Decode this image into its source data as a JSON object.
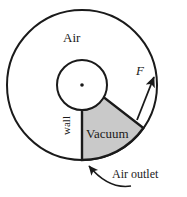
{
  "figure": {
    "labels": {
      "air": "Air",
      "vacuum": "Vacuum",
      "wall": "wall",
      "air_outlet": "Air outlet",
      "force": "F"
    },
    "colors": {
      "stroke": "#1a1a1a",
      "vacuum_fill": "#c9c9c9",
      "background": "#ffffff",
      "text": "#1a1a1a"
    },
    "geometry": {
      "center_x": 82,
      "center_y": 85,
      "outer_radius": 75,
      "inner_radius": 25,
      "sector_start_angle_deg": 90,
      "sector_end_angle_deg": 35,
      "force_arrow_angle_deg": 40
    },
    "icons": {
      "center_dot": "center-dot",
      "force_arrow": "force-arrow",
      "outlet_arrow": "curved-outlet-arrow"
    }
  }
}
